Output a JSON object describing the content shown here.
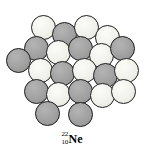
{
  "figure": {
    "background_color": "#ffffff"
  },
  "nucleus": {
    "description": "Close-packed cluster of nucleons representing the Neon-22 nucleus",
    "proton_color": "#f1f1ec",
    "neutron_color": "#a1a1a1",
    "outline_color": "#202020",
    "proton_count": 10,
    "neutron_count": 12,
    "total_nucleons": 22,
    "circle_diameter": 25,
    "nucleons": [
      {
        "id": "n01",
        "kind": "proton",
        "cx": 43,
        "cy": 27
      },
      {
        "id": "n02",
        "kind": "neutron",
        "cx": 64,
        "cy": 34
      },
      {
        "id": "n03",
        "kind": "proton",
        "cx": 86,
        "cy": 27
      },
      {
        "id": "n04",
        "kind": "proton",
        "cx": 107,
        "cy": 37
      },
      {
        "id": "n05",
        "kind": "neutron",
        "cx": 36,
        "cy": 48
      },
      {
        "id": "n06",
        "kind": "proton",
        "cx": 58,
        "cy": 52
      },
      {
        "id": "n07",
        "kind": "neutron",
        "cx": 80,
        "cy": 48
      },
      {
        "id": "n08",
        "kind": "proton",
        "cx": 101,
        "cy": 55
      },
      {
        "id": "n09",
        "kind": "neutron",
        "cx": 122,
        "cy": 48
      },
      {
        "id": "n10",
        "kind": "neutron",
        "cx": 18,
        "cy": 60
      },
      {
        "id": "n11",
        "kind": "proton",
        "cx": 40,
        "cy": 70
      },
      {
        "id": "n12",
        "kind": "neutron",
        "cx": 62,
        "cy": 73
      },
      {
        "id": "n13",
        "kind": "proton",
        "cx": 84,
        "cy": 70
      },
      {
        "id": "n14",
        "kind": "neutron",
        "cx": 105,
        "cy": 75
      },
      {
        "id": "n15",
        "kind": "proton",
        "cx": 126,
        "cy": 70
      },
      {
        "id": "n16",
        "kind": "neutron",
        "cx": 36,
        "cy": 91
      },
      {
        "id": "n17",
        "kind": "proton",
        "cx": 58,
        "cy": 94
      },
      {
        "id": "n18",
        "kind": "neutron",
        "cx": 80,
        "cy": 91
      },
      {
        "id": "n19",
        "kind": "proton",
        "cx": 102,
        "cy": 95
      },
      {
        "id": "n20",
        "kind": "proton",
        "cx": 123,
        "cy": 91
      },
      {
        "id": "n21",
        "kind": "neutron",
        "cx": 47,
        "cy": 113
      },
      {
        "id": "n22",
        "kind": "neutron",
        "cx": 80,
        "cy": 114
      }
    ]
  },
  "label": {
    "mass_number": "22",
    "atomic_number": "10",
    "element_symbol": "Ne",
    "full_text": "22/10 Ne"
  }
}
